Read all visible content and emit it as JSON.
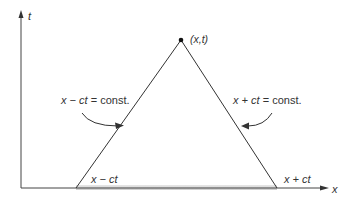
{
  "diagram": {
    "type": "characteristics-domain-of-dependence",
    "axes": {
      "vertical_label": "t",
      "horizontal_label": "x"
    },
    "apex": {
      "label": "(x,t)"
    },
    "left_characteristic": {
      "label": "x − ct = const.",
      "label_var": "x − ",
      "label_ct": "ct",
      "label_rest": " = const.",
      "base_label": "x − ct"
    },
    "right_characteristic": {
      "label": "x + ct = const.",
      "label_var": "x + ",
      "label_ct": "ct",
      "label_rest": " = const.",
      "base_label": "x + ct"
    },
    "colors": {
      "line": "#333333",
      "shade": "#d8d8d8",
      "text": "#333333"
    }
  }
}
